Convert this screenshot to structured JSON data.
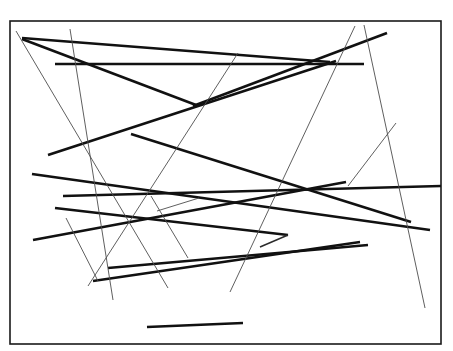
{
  "figure": {
    "width": 453,
    "height": 351,
    "background_color": "#ffffff",
    "frame": {
      "name": "border-frame",
      "x": 10,
      "y": 21,
      "width": 431,
      "height": 323,
      "stroke_color": "#1a1a1a",
      "stroke_width": 1.6
    },
    "stroke_colors": {
      "thick": "#111111",
      "thin": "#4d4d4d",
      "hair": "#2b2b2b"
    },
    "segments": [
      {
        "id": "seg-01",
        "weight": "thick",
        "x1": 22,
        "y1": 38,
        "x2": 330,
        "y2": 62
      },
      {
        "id": "seg-02",
        "weight": "thick",
        "x1": 22,
        "y1": 39,
        "x2": 196,
        "y2": 105
      },
      {
        "id": "seg-03",
        "weight": "thick",
        "x1": 55,
        "y1": 64,
        "x2": 364,
        "y2": 64
      },
      {
        "id": "seg-04",
        "weight": "thick",
        "x1": 193,
        "y1": 106,
        "x2": 387,
        "y2": 33
      },
      {
        "id": "seg-05",
        "weight": "thick",
        "x1": 48,
        "y1": 155,
        "x2": 336,
        "y2": 61
      },
      {
        "id": "seg-06",
        "weight": "thick",
        "x1": 131,
        "y1": 134,
        "x2": 411,
        "y2": 222
      },
      {
        "id": "seg-07",
        "weight": "thick",
        "x1": 32,
        "y1": 174,
        "x2": 430,
        "y2": 230
      },
      {
        "id": "seg-08",
        "weight": "thick",
        "x1": 63,
        "y1": 196,
        "x2": 441,
        "y2": 186
      },
      {
        "id": "seg-09",
        "weight": "thick",
        "x1": 33,
        "y1": 240,
        "x2": 346,
        "y2": 182
      },
      {
        "id": "seg-10",
        "weight": "thick",
        "x1": 55,
        "y1": 208,
        "x2": 288,
        "y2": 235
      },
      {
        "id": "seg-11",
        "weight": "thick",
        "x1": 108,
        "y1": 268,
        "x2": 368,
        "y2": 245
      },
      {
        "id": "seg-12",
        "weight": "thick",
        "x1": 93,
        "y1": 281,
        "x2": 360,
        "y2": 242
      },
      {
        "id": "seg-13",
        "weight": "thick",
        "x1": 147,
        "y1": 327,
        "x2": 243,
        "y2": 323
      },
      {
        "id": "seg-14",
        "weight": "thin",
        "x1": 16,
        "y1": 31,
        "x2": 168,
        "y2": 288
      },
      {
        "id": "seg-15",
        "weight": "thin",
        "x1": 70,
        "y1": 29,
        "x2": 113,
        "y2": 300
      },
      {
        "id": "seg-16",
        "weight": "thin",
        "x1": 238,
        "y1": 53,
        "x2": 88,
        "y2": 286
      },
      {
        "id": "seg-17",
        "weight": "thin",
        "x1": 355,
        "y1": 26,
        "x2": 230,
        "y2": 292
      },
      {
        "id": "seg-18",
        "weight": "thin",
        "x1": 364,
        "y1": 25,
        "x2": 425,
        "y2": 308
      },
      {
        "id": "seg-19",
        "weight": "thin",
        "x1": 348,
        "y1": 186,
        "x2": 396,
        "y2": 123
      },
      {
        "id": "seg-20",
        "weight": "thin",
        "x1": 199,
        "y1": 198,
        "x2": 157,
        "y2": 211
      },
      {
        "id": "seg-21",
        "weight": "thin",
        "x1": 151,
        "y1": 196,
        "x2": 188,
        "y2": 258
      },
      {
        "id": "seg-22",
        "weight": "hair",
        "x1": 288,
        "y1": 235,
        "x2": 260,
        "y2": 247
      },
      {
        "id": "seg-23",
        "weight": "thin",
        "x1": 66,
        "y1": 218,
        "x2": 98,
        "y2": 281
      }
    ]
  }
}
